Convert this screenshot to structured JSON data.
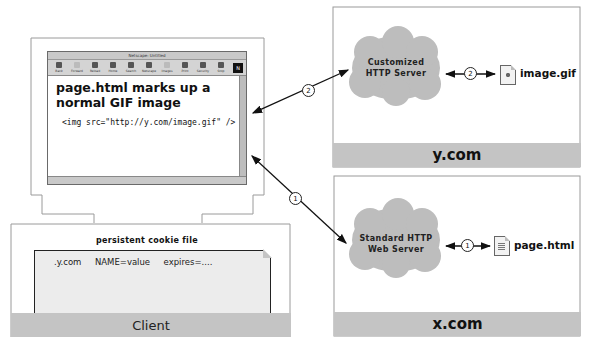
{
  "client": {
    "label": "Client",
    "browser": {
      "title": "Netscape: Untitled",
      "toolbar": [
        {
          "label": "Back",
          "icon": "back-icon",
          "enabled": true
        },
        {
          "label": "Forward",
          "icon": "forward-icon",
          "enabled": false
        },
        {
          "label": "Reload",
          "icon": "reload-icon",
          "enabled": true
        },
        {
          "label": "Home",
          "icon": "home-icon",
          "enabled": true
        },
        {
          "label": "Search",
          "icon": "search-icon",
          "enabled": true
        },
        {
          "label": "Netscape",
          "icon": "netscape-icon",
          "enabled": true
        },
        {
          "label": "Images",
          "icon": "images-icon",
          "enabled": false
        },
        {
          "label": "Print",
          "icon": "print-icon",
          "enabled": true
        },
        {
          "label": "Security",
          "icon": "security-icon",
          "enabled": true
        },
        {
          "label": "Stop",
          "icon": "stop-icon",
          "enabled": true
        }
      ],
      "logo": "N",
      "content": {
        "heading": "page.html marks up a normal GIF image",
        "code": "<img src=\"http://y.com/image.gif\" />"
      }
    },
    "cookie_file": {
      "label": "persistent cookie file",
      "entry": ".y.com     NAME=value     expires=...."
    }
  },
  "servers": {
    "y_com": {
      "domain": "y.com",
      "server_label_line1": "Customized",
      "server_label_line2": "HTTP Server",
      "file": "image.gif",
      "step": "2"
    },
    "x_com": {
      "domain": "x.com",
      "server_label_line1": "Standard HTTP",
      "server_label_line2": "Web Server",
      "file": "page.html",
      "step": "1"
    }
  },
  "connections": [
    {
      "step": "1",
      "from": "browser",
      "to": "x.com server"
    },
    {
      "step": "2",
      "from": "browser",
      "to": "y.com server"
    }
  ],
  "colors": {
    "bar": "#c4c4c4",
    "cloud": "#bdbdbd",
    "outline": "#9a9a9a"
  }
}
